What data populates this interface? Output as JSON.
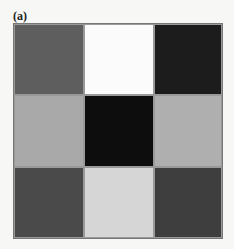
{
  "figure": {
    "label": "(a)",
    "grid": {
      "rows": 3,
      "cols": 3,
      "cells": [
        {
          "row": 0,
          "col": 0,
          "shade": "dark-gray",
          "color": "#5e5e5e"
        },
        {
          "row": 0,
          "col": 1,
          "shade": "white",
          "color": "#fbfbfb"
        },
        {
          "row": 0,
          "col": 2,
          "shade": "near-black",
          "color": "#1c1c1c"
        },
        {
          "row": 1,
          "col": 0,
          "shade": "light-gray",
          "color": "#a9a9a9"
        },
        {
          "row": 1,
          "col": 1,
          "shade": "black",
          "color": "#0d0d0d"
        },
        {
          "row": 1,
          "col": 2,
          "shade": "light-gray",
          "color": "#afafaf"
        },
        {
          "row": 2,
          "col": 0,
          "shade": "dark-gray",
          "color": "#4a4a4a"
        },
        {
          "row": 2,
          "col": 1,
          "shade": "very-light-gray",
          "color": "#d6d6d6"
        },
        {
          "row": 2,
          "col": 2,
          "shade": "dark-gray",
          "color": "#3e3e3e"
        }
      ]
    }
  }
}
